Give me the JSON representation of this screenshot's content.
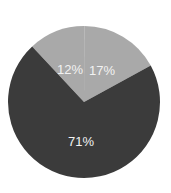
{
  "chart_data": {
    "type": "pie",
    "title": "",
    "categories": [
      "A",
      "B",
      "C"
    ],
    "values": [
      12,
      17,
      71
    ],
    "labels": [
      "12%",
      "17%",
      "71%"
    ],
    "colors": [
      "#a9a9a9",
      "#a9a9a9",
      "#3b3b3b"
    ],
    "start_angle_deg": -43,
    "direction": "clockwise",
    "legend": "none",
    "label_positions": [
      {
        "x": 70,
        "y": 69
      },
      {
        "x": 102,
        "y": 70
      },
      {
        "x": 81,
        "y": 141
      }
    ]
  },
  "geometry": {
    "cx": 84,
    "cy": 102,
    "r": 76
  }
}
